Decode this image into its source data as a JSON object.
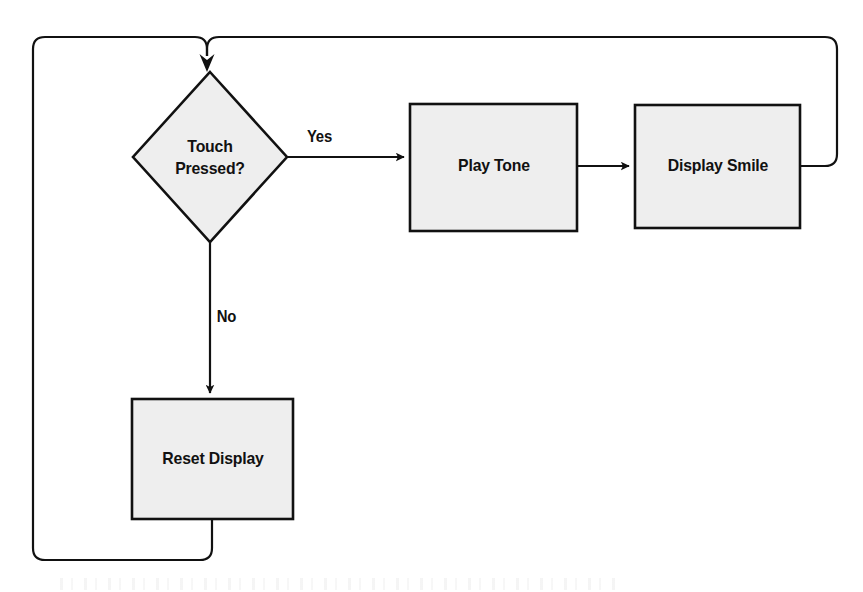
{
  "diagram": {
    "type": "flowchart",
    "orientation": "left-to-right with feedback loops",
    "colors": {
      "node_fill": "#eeeeee",
      "node_stroke": "#111111",
      "edge_stroke": "#111111",
      "text": "#111111",
      "background": "#ffffff"
    },
    "nodes": [
      {
        "id": "touch-pressed",
        "shape": "diamond",
        "label": "Touch Pressed?",
        "label_line1": "Touch",
        "label_line2": "Pressed?"
      },
      {
        "id": "play-tone",
        "shape": "rectangle",
        "label": "Play Tone"
      },
      {
        "id": "display-smile",
        "shape": "rectangle",
        "label": "Display Smile"
      },
      {
        "id": "reset-display",
        "shape": "rectangle",
        "label": "Reset Display"
      }
    ],
    "edges": [
      {
        "id": "yes-branch",
        "from": "touch-pressed",
        "to": "play-tone",
        "label": "Yes",
        "arrow": true
      },
      {
        "id": "tone-to-smile",
        "from": "play-tone",
        "to": "display-smile",
        "label": "",
        "arrow": true
      },
      {
        "id": "no-branch",
        "from": "touch-pressed",
        "to": "reset-display",
        "label": "No",
        "arrow": true
      },
      {
        "id": "smile-loopback",
        "from": "display-smile",
        "to": "touch-pressed",
        "label": "",
        "arrow": true
      },
      {
        "id": "reset-loopback",
        "from": "reset-display",
        "to": "touch-pressed",
        "label": "",
        "arrow": true
      }
    ]
  }
}
